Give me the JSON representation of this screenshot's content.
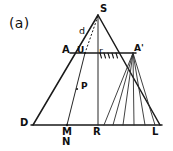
{
  "figure": {
    "panel_tag": "(a)",
    "type": "geometric-diagram",
    "stroke_color": "#1a1a1a",
    "background_color": "#ffffff",
    "labels": {
      "apex": "S",
      "chord_left": "A",
      "chord_right": "A'",
      "chord_inner": "U",
      "radius": "r",
      "slant": "d",
      "interior_point": "P",
      "base_left": "D",
      "base_m": "M",
      "base_n": "N",
      "base_r": "R",
      "base_right": "L"
    },
    "points": {
      "S": {
        "x": 98,
        "y": 15
      },
      "D": {
        "x": 33,
        "y": 125
      },
      "L": {
        "x": 160,
        "y": 125
      },
      "A": {
        "x": 73,
        "y": 53
      },
      "Aprime": {
        "x": 133,
        "y": 53
      },
      "U": {
        "x": 85,
        "y": 53
      },
      "R": {
        "x": 98,
        "y": 125
      },
      "M": {
        "x": 67,
        "y": 125
      },
      "P": {
        "x": 77,
        "y": 89
      }
    },
    "fan_base_x": [
      104,
      113,
      123,
      134,
      145,
      155
    ],
    "tick_base_x": [
      100,
      105,
      110,
      115,
      120
    ],
    "label_positions": {
      "panel_tag": {
        "left": 9,
        "top": 16
      },
      "S": {
        "left": 100,
        "top": 4
      },
      "d": {
        "left": 79,
        "top": 26
      },
      "A": {
        "left": 62,
        "top": 45
      },
      "U": {
        "left": 77,
        "top": 46
      },
      "r": {
        "left": 98,
        "top": 46
      },
      "Aprime": {
        "left": 134,
        "top": 44
      },
      "P": {
        "left": 81,
        "top": 82
      },
      "D": {
        "left": 20,
        "top": 118
      },
      "M": {
        "left": 62,
        "top": 127
      },
      "N": {
        "left": 62,
        "top": 137
      },
      "R": {
        "left": 93,
        "top": 127
      },
      "L": {
        "left": 152,
        "top": 127
      }
    }
  }
}
